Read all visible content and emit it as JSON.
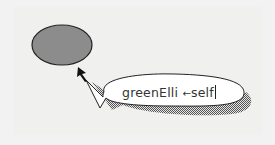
{
  "canvas": {
    "background": "#f0f0ee"
  },
  "ellipse": {
    "name": "greenElli",
    "fill": "#8c8c8c",
    "stroke": "#222222"
  },
  "speech_bubble": {
    "target_label": "greenElli",
    "assign_arrow": "←",
    "value": "self",
    "fill": "#ffffff",
    "shadow_pattern": "checkered-gray"
  }
}
